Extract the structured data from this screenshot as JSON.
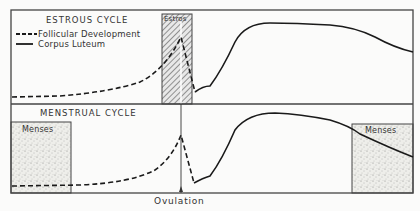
{
  "diagram": {
    "panels": [
      {
        "title": "ESTROUS CYCLE",
        "period_label": "Estros"
      },
      {
        "title": "MENSTRUAL CYCLE",
        "period_label_left": "Menses",
        "period_label_right": "Menses"
      }
    ],
    "legend": [
      {
        "style": "dashed",
        "label": "Follicular Development"
      },
      {
        "style": "solid",
        "label": "Corpus Luteum"
      }
    ],
    "annotation": "Ovulation",
    "colors": {
      "line": "#1a1a1a",
      "frame": "#444444",
      "background": "#fbfbfa"
    }
  }
}
